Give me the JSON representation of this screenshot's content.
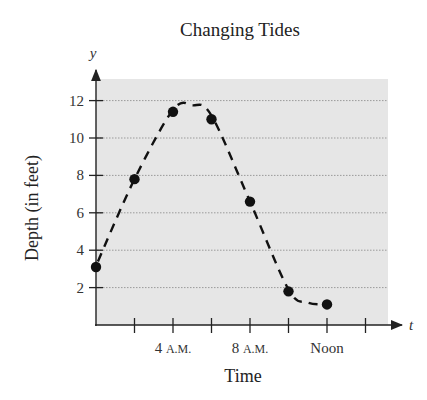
{
  "chart_data": {
    "type": "scatter",
    "title": "Changing Tides",
    "xlabel": "Time",
    "ylabel": "Depth (in feet)",
    "x_axis_variable": "t",
    "y_axis_variable": "y",
    "x_unit": "hours after midnight",
    "x": [
      0,
      2,
      4,
      6,
      8,
      10,
      12
    ],
    "values": [
      3.1,
      7.8,
      11.4,
      11.0,
      6.6,
      1.8,
      1.1
    ],
    "series": [
      {
        "name": "Depth",
        "style": "points with dashed smooth curve",
        "x": [
          0,
          2,
          4,
          6,
          8,
          10,
          12
        ],
        "values": [
          3.1,
          7.8,
          11.4,
          11.0,
          6.6,
          1.8,
          1.1
        ]
      }
    ],
    "x_ticks": [
      0,
      2,
      4,
      6,
      8,
      10,
      12,
      14
    ],
    "x_tick_labels": [
      {
        "value": 4,
        "label": "4 A.M."
      },
      {
        "value": 8,
        "label": "8 A.M."
      },
      {
        "value": 12,
        "label": "Noon"
      }
    ],
    "y_ticks": [
      2,
      4,
      6,
      8,
      10,
      12
    ],
    "y_tick_labels": [
      "2",
      "4",
      "6",
      "8",
      "10",
      "12"
    ],
    "xlim": [
      0,
      15
    ],
    "ylim": [
      0,
      13
    ],
    "grid": {
      "horizontal": true,
      "vertical": false,
      "style": "dotted"
    },
    "legend": null,
    "colors": {
      "plot_background": "#e6e6e6",
      "gridline": "#9a9a9a",
      "points": "#111111",
      "curve": "#111111"
    }
  }
}
